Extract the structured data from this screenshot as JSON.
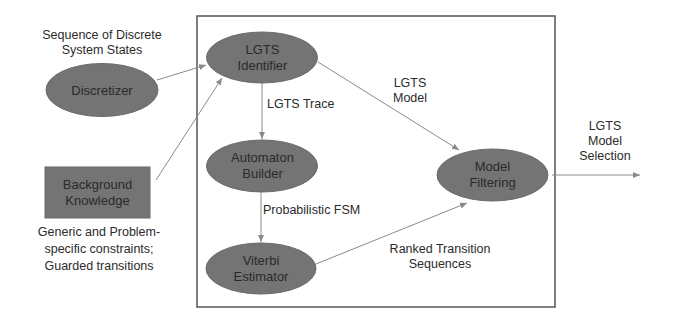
{
  "diagram": {
    "colors": {
      "node_fill": "#747474",
      "node_stroke": "#6a6a6a",
      "arrow": "#8a8a8a",
      "frame": "#555555",
      "text": "#2a2a2a"
    },
    "inputs": {
      "discretizer": {
        "label_line1": "Discretizer",
        "caption_line1": "Sequence of Discrete",
        "caption_line2": "System States"
      },
      "background_knowledge": {
        "label_line1": "Background",
        "label_line2": "Knowledge",
        "caption_line1": "Generic and Problem-",
        "caption_line2": "specific constraints;",
        "caption_line3": "Guarded transitions"
      }
    },
    "nodes": {
      "lgts_identifier": {
        "line1": "LGTS",
        "line2": "Identifier"
      },
      "automaton_builder": {
        "line1": "Automaton",
        "line2": "Builder"
      },
      "viterbi_estimator": {
        "line1": "Viterbi",
        "line2": "Estimator"
      },
      "model_filtering": {
        "line1": "Model",
        "line2": "Filtering"
      }
    },
    "edge_labels": {
      "lgts_trace": "LGTS Trace",
      "probabilistic_fsm": "Probabilistic FSM",
      "lgts_model_line1": "LGTS",
      "lgts_model_line2": "Model",
      "ranked_line1": "Ranked Transition",
      "ranked_line2": "Sequences"
    },
    "output": {
      "line1": "LGTS",
      "line2": "Model",
      "line3": "Selection"
    }
  }
}
